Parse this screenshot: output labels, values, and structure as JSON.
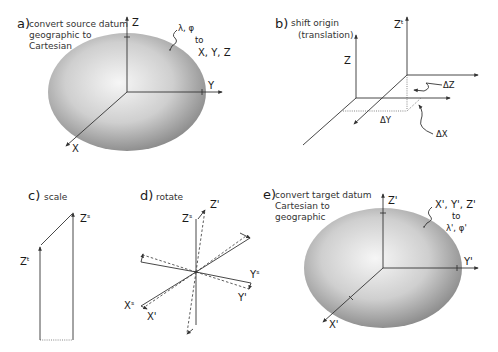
{
  "figure": {
    "panels": [
      {
        "id": "a",
        "letter": "a)",
        "desc_lines": [
          "convert source datum",
          "geographic to",
          "Cartesian"
        ],
        "axes": {
          "z": "Z",
          "y": "Y",
          "x": "X"
        },
        "annot_from": "λ, φ",
        "annot_to_word": "to",
        "annot_to": "X, Y, Z"
      },
      {
        "id": "b",
        "letter": "b)",
        "desc_lines": [
          "shift origin",
          "(translation)"
        ],
        "axes": {
          "z": "Z",
          "zt": "Zᵗ"
        },
        "deltas": {
          "dz": "ΔZ",
          "dy": "ΔY",
          "dx": "ΔX"
        }
      },
      {
        "id": "c",
        "letter": "c)",
        "desc_lines": [
          "scale"
        ],
        "axes": {
          "zt": "Zᵗ",
          "zs": "Zˢ"
        }
      },
      {
        "id": "d",
        "letter": "d)",
        "desc_lines": [
          "rotate"
        ],
        "axes": {
          "zs": "Zˢ",
          "zp": "Z'",
          "ys": "Yˢ",
          "yp": "Y'",
          "xs": "Xˢ",
          "xp": "X'"
        }
      },
      {
        "id": "e",
        "letter": "e)",
        "desc_lines": [
          "convert target datum",
          "Cartesian to",
          "geographic"
        ],
        "axes": {
          "z": "Z'",
          "y": "Y'",
          "x": "X'"
        },
        "annot_from": "X', Y', Z'",
        "annot_to_word": "to",
        "annot_to": "λ', φ'"
      }
    ],
    "colors": {
      "ellipsoid_light": "#f4f4f4",
      "ellipsoid_dark": "#8a8a8a",
      "line": "#333333"
    }
  }
}
